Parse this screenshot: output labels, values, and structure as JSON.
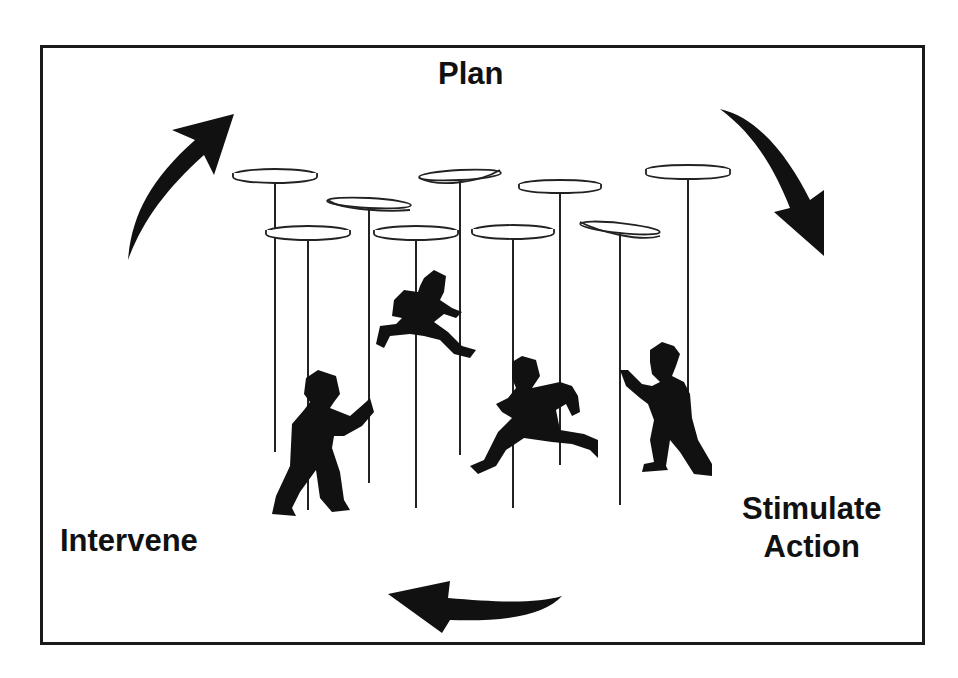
{
  "diagram": {
    "type": "cycle",
    "theme": "spinning plates — managing multiple activities at once",
    "stages": [
      {
        "id": "plan",
        "label": "Plan",
        "position": "top"
      },
      {
        "id": "stimulate_action",
        "label_line1": "Stimulate",
        "label_line2": "Action",
        "position": "bottom-right"
      },
      {
        "id": "intervene",
        "label": "Intervene",
        "position": "bottom-left"
      }
    ],
    "flow": "clockwise",
    "arrows": [
      {
        "name": "arrow-intervene-to-plan",
        "direction": "up-right"
      },
      {
        "name": "arrow-plan-to-stimulate",
        "direction": "down-right"
      },
      {
        "name": "arrow-stimulate-to-intervene",
        "direction": "left"
      }
    ],
    "illustration": {
      "plate_count": 9,
      "figure_count": 4,
      "figures": [
        "person pushing pole (left)",
        "person running (upper center)",
        "person running (center)",
        "person pushing pole (right)"
      ]
    },
    "colors": {
      "ink": "#111111",
      "background": "#ffffff"
    }
  }
}
